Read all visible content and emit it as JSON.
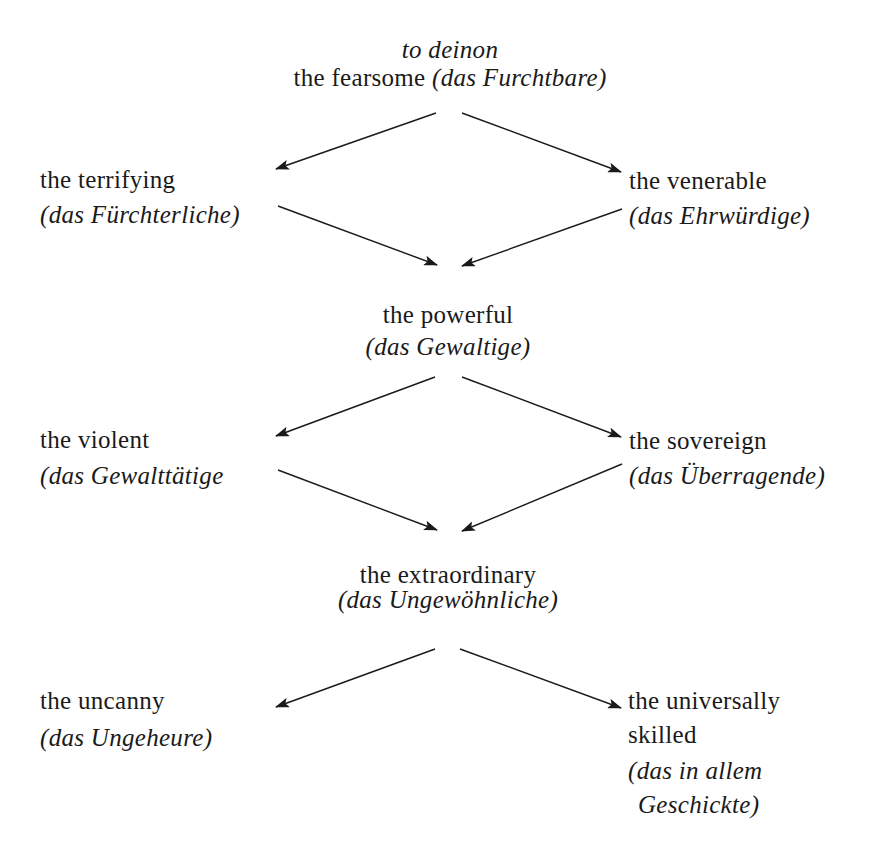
{
  "diagram": {
    "root": {
      "title_italic": "to deinon",
      "label": "the fearsome",
      "german": "(das Furchtbare)"
    },
    "level1": {
      "left": {
        "label": "the terrifying",
        "german": "(das Fürchterliche)"
      },
      "right": {
        "label": "the venerable",
        "german": "(das Ehrwürdige)"
      }
    },
    "merge1": {
      "label": "the powerful",
      "german": "(das Gewaltige)"
    },
    "level2": {
      "left": {
        "label": "the violent",
        "german": "(das Gewalttätige"
      },
      "right": {
        "label": "the sovereign",
        "german": "(das Überragende)"
      }
    },
    "merge2": {
      "label": "the extraordinary",
      "german": "(das Ungewöhnliche)"
    },
    "level3": {
      "left": {
        "label": "the uncanny",
        "german": "(das Ungeheure)"
      },
      "right": {
        "label_line1": "the universally",
        "label_line2": "skilled",
        "german_line1": "(das in allem",
        "german_line2": "Geschickte)"
      }
    }
  },
  "arrows": [
    {
      "from": "root",
      "to": "level1.left",
      "x1": 436,
      "y1": 113,
      "x2": 276,
      "y2": 169
    },
    {
      "from": "root",
      "to": "level1.right",
      "x1": 462,
      "y1": 113,
      "x2": 621,
      "y2": 172
    },
    {
      "from": "level1.left",
      "to": "merge1",
      "x1": 278,
      "y1": 206,
      "x2": 437,
      "y2": 265
    },
    {
      "from": "level1.right",
      "to": "merge1",
      "x1": 622,
      "y1": 209,
      "x2": 462,
      "y2": 266
    },
    {
      "from": "merge1",
      "to": "level2.left",
      "x1": 435,
      "y1": 377,
      "x2": 276,
      "y2": 436
    },
    {
      "from": "merge1",
      "to": "level2.right",
      "x1": 462,
      "y1": 377,
      "x2": 621,
      "y2": 437
    },
    {
      "from": "level2.left",
      "to": "merge2",
      "x1": 278,
      "y1": 470,
      "x2": 437,
      "y2": 530
    },
    {
      "from": "level2.right",
      "to": "merge2",
      "x1": 622,
      "y1": 464,
      "x2": 462,
      "y2": 531
    },
    {
      "from": "merge2",
      "to": "level3.left",
      "x1": 435,
      "y1": 649,
      "x2": 276,
      "y2": 707
    },
    {
      "from": "merge2",
      "to": "level3.right",
      "x1": 460,
      "y1": 649,
      "x2": 621,
      "y2": 708
    }
  ],
  "colors": {
    "ink": "#1a1a1a",
    "background": "#ffffff"
  }
}
